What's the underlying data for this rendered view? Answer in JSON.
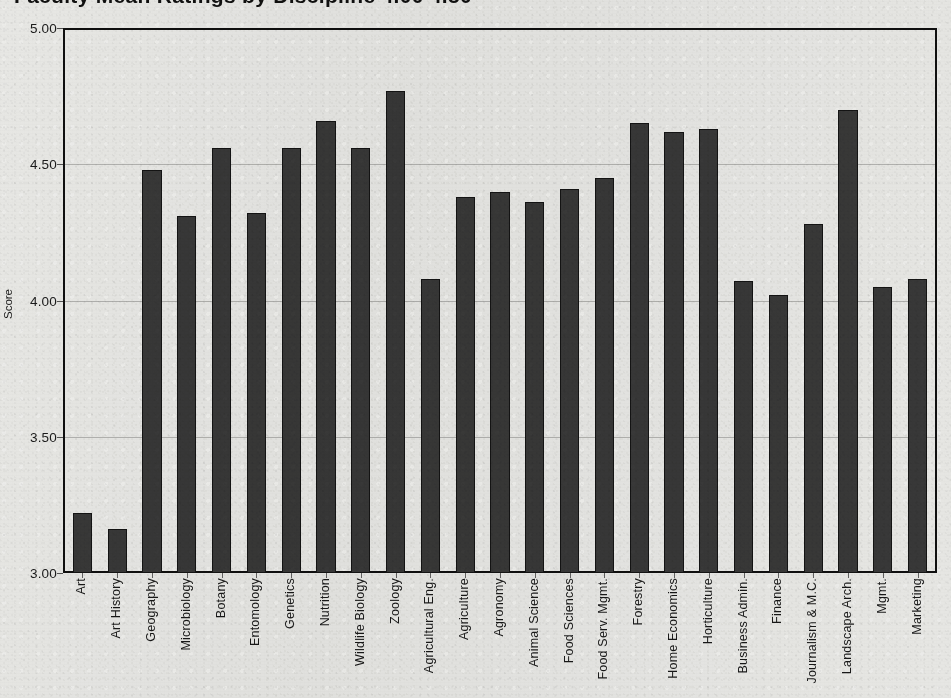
{
  "chart_data": {
    "type": "bar",
    "title": "Faculty Mean Ratings by Discipline   4.00   4.50",
    "xlabel": "",
    "ylabel": "Score",
    "ylim": [
      3.0,
      5.0
    ],
    "ytick_labels": [
      "5.00",
      "4.50",
      "4.00",
      "3.50",
      "3.00"
    ],
    "ytick_values": [
      5.0,
      4.5,
      4.0,
      3.5,
      3.0
    ],
    "grid": true,
    "legend": null,
    "bar_color": "#3a3a3a",
    "categories": [
      "Art",
      "Art History",
      "Geography",
      "Microbiology",
      "Botany",
      "Entomology",
      "Genetics",
      "Nutrition",
      "Wildlife  Biology",
      "Zoology",
      "Agricultural Eng.",
      "Agriculture",
      "Agronomy",
      "Animal Science",
      "Food Sciences",
      "Food Serv. Mgmt.",
      "Forestry",
      "Home Economics",
      "Horticulture",
      "Business Admin.",
      "Finance",
      "Journalism & M.C.",
      "Landscape Arch.",
      "Mgmt.",
      "Marketing"
    ],
    "values": [
      3.22,
      3.16,
      4.48,
      4.31,
      4.56,
      4.32,
      4.56,
      4.66,
      4.56,
      4.77,
      4.08,
      4.38,
      4.4,
      4.36,
      4.41,
      4.45,
      4.65,
      4.62,
      4.63,
      4.07,
      4.02,
      4.28,
      4.7,
      4.05,
      4.08
    ]
  }
}
